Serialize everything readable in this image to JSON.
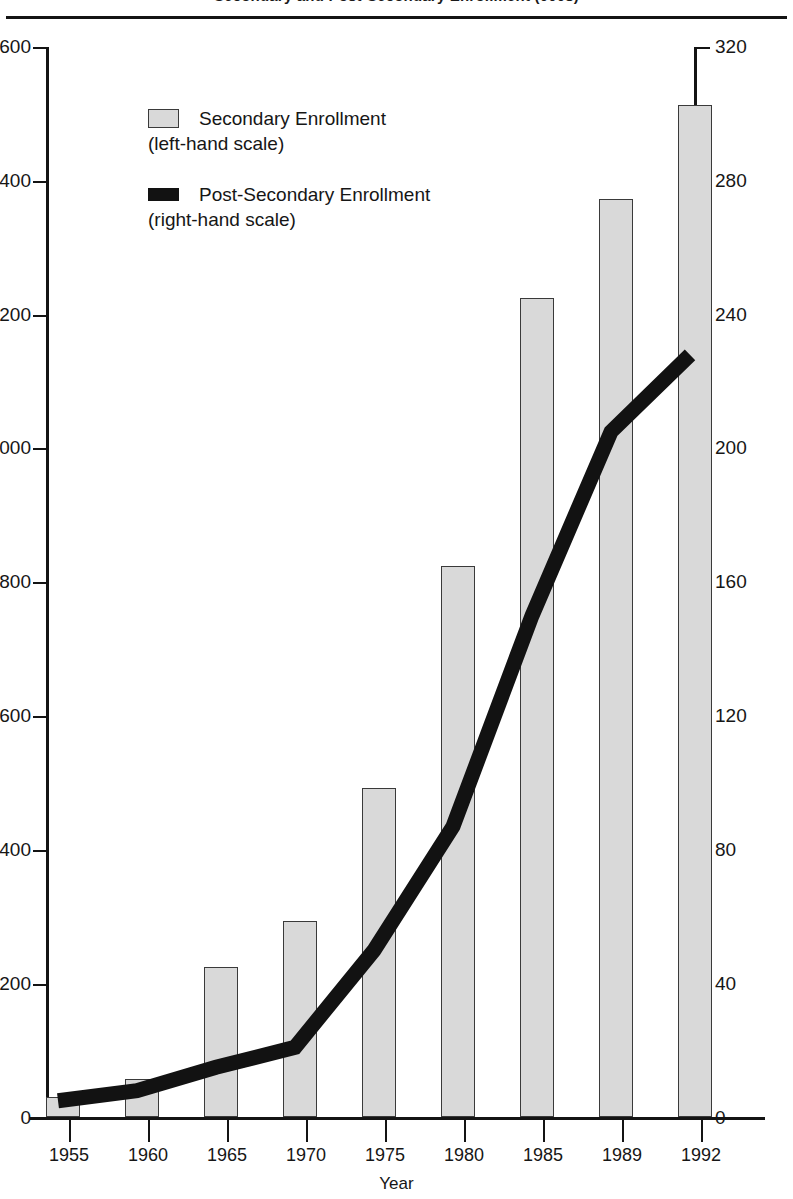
{
  "chart": {
    "title": "Secondary and Post-Secondary Enrollment (000s)",
    "xlabel": "Year",
    "legend": [
      {
        "label": "Secondary Enrollment",
        "sub": "(left-hand scale)",
        "swatch": "bar-sw",
        "name": "legend-swatch-secondary"
      },
      {
        "label": "Post-Secondary Enrollment",
        "sub": "(right-hand scale)",
        "swatch": "line-sw",
        "name": "legend-swatch-post-secondary"
      }
    ],
    "left_ticks": [
      "1,600",
      "1,400",
      "1,200",
      "1,000",
      "800",
      "600",
      "400",
      "200",
      "0"
    ],
    "right_ticks": [
      "320",
      "280",
      "240",
      "200",
      "160",
      "120",
      "80",
      "40",
      "0"
    ],
    "x_ticks": [
      "1955",
      "1960",
      "1965",
      "1970",
      "1975",
      "1980",
      "1985",
      "1989",
      "1992"
    ]
  },
  "colors": {
    "bar_fill": "#d9d9d9",
    "bar_stroke": "#3a3a3a",
    "line": "#121212",
    "axis": "#141414",
    "text": "#161616",
    "background": "#ffffff"
  },
  "chart_data": {
    "type": "bar",
    "title": "Secondary and Post-Secondary Enrollment (000s)",
    "xlabel": "Year",
    "ylabel": "Secondary Enrollment (thousands)",
    "y2label": "Post-Secondary Enrollment (thousands)",
    "categories": [
      "1955",
      "1960",
      "1965",
      "1970",
      "1975",
      "1980",
      "1985",
      "1989",
      "1992"
    ],
    "ylim": [
      0,
      1600
    ],
    "y2lim": [
      0,
      320
    ],
    "yticks": [
      0,
      200,
      400,
      600,
      800,
      1000,
      1200,
      1400,
      1600
    ],
    "y2ticks": [
      0,
      40,
      80,
      120,
      160,
      200,
      240,
      280,
      320
    ],
    "grid": false,
    "legend_position": "upper-left-inside",
    "series": [
      {
        "name": "Secondary Enrollment",
        "type": "bar",
        "axis": "left",
        "note": "(left-hand scale)",
        "values": [
          30,
          57,
          225,
          293,
          492,
          825,
          1225,
          1373,
          1513
        ]
      },
      {
        "name": "Post-Secondary Enrollment",
        "type": "line",
        "axis": "right",
        "note": "(right-hand scale)",
        "values": [
          5,
          8,
          15,
          21,
          50,
          87,
          150,
          205,
          228
        ]
      }
    ]
  }
}
